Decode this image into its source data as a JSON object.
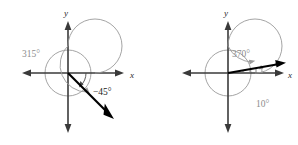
{
  "figure": {
    "background_color": "#ffffff",
    "panels": [
      {
        "id": "left",
        "name": "coterminal-315-and-negative-45",
        "origin": {
          "x": 68,
          "y": 73
        },
        "circle_radius": 23,
        "axes": {
          "x_label": "x",
          "y_label": "y",
          "x_label_pos": {
            "x": 131,
            "y": 76
          },
          "y_label_pos": {
            "x": 64,
            "y": 14
          },
          "x_left_end": 22,
          "x_right_end": 122,
          "y_top_end": 22,
          "y_bottom_end": 132,
          "color": "#3a3a3a"
        },
        "terminal_ray": {
          "angle_degrees": -45,
          "length": 62,
          "color": "#000000"
        },
        "angles": [
          {
            "name": "positive-coterminal-angle",
            "label": "315°",
            "value_degrees": 315,
            "direction": "counterclockwise",
            "color": "#8d8d8d",
            "label_pos": {
              "x": 24,
              "y": 55
            },
            "arc_radius": 27,
            "arc_start_deg": 0,
            "arc_end_deg": 315
          },
          {
            "name": "negative-angle",
            "label": "−45°",
            "value_degrees": -45,
            "direction": "clockwise",
            "color": "#1a1a1a",
            "label_pos": {
              "x": 95,
              "y": 93
            },
            "arc_radius": 18,
            "arc_start_deg": 0,
            "arc_end_deg": -45
          }
        ]
      },
      {
        "id": "right",
        "name": "coterminal-370-and-10",
        "origin": {
          "x": 228,
          "y": 73
        },
        "circle_radius": 23,
        "axes": {
          "x_label": "x",
          "y_label": "y",
          "x_label_pos": {
            "x": 288,
            "y": 76
          },
          "y_label_pos": {
            "x": 224,
            "y": 14
          },
          "x_left_end": 182,
          "x_right_end": 281,
          "y_top_end": 22,
          "y_bottom_end": 132,
          "color": "#3a3a3a"
        },
        "terminal_ray": {
          "angle_degrees": 10,
          "length": 62,
          "color": "#000000"
        },
        "angles": [
          {
            "name": "full-turn-plus-angle",
            "label": "370°",
            "value_degrees": 370,
            "direction": "counterclockwise",
            "color": "#8d8d8d",
            "label_pos": {
              "x": 237,
              "y": 55
            },
            "arc_radius": 27,
            "arc_start_deg": 0,
            "arc_end_deg": 370
          },
          {
            "name": "small-coterminal-angle",
            "label": "10°",
            "value_degrees": 10,
            "direction": "counterclockwise",
            "color": "#8d8d8d",
            "label_pos": {
              "x": 259,
              "y": 105
            },
            "arc_radius": 34,
            "arc_start_deg": 0,
            "arc_end_deg": 10
          }
        ]
      }
    ]
  }
}
